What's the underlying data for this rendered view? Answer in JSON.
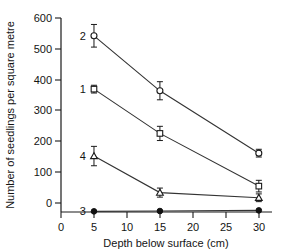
{
  "chart_data": {
    "type": "line",
    "title": "",
    "xlabel": "Depth below surface (cm)",
    "ylabel": "Number of seedlings per square metre",
    "x": [
      5,
      15,
      30
    ],
    "xlim": [
      0,
      32
    ],
    "ylim": [
      0,
      600
    ],
    "xticks": [
      0,
      5,
      10,
      15,
      20,
      25,
      30
    ],
    "xtick_labels": [
      "0",
      "5",
      "10",
      "15",
      "20",
      "25",
      "30"
    ],
    "yticks": [
      0,
      100,
      200,
      300,
      400,
      500,
      600
    ],
    "ytick_labels": [
      "0",
      "100",
      "200",
      "300",
      "400",
      "500",
      "600"
    ],
    "grid": false,
    "legend": "inline-labels-at-left-of-each-series",
    "series": [
      {
        "name": "2",
        "label": "2",
        "marker": "open-circle",
        "values": [
          545,
          375,
          182
        ],
        "errors": [
          35,
          28,
          12
        ],
        "label_x": 5,
        "label_y": 545
      },
      {
        "name": "1",
        "label": "1",
        "marker": "open-square",
        "values": [
          380,
          243,
          80
        ],
        "errors": [
          12,
          22,
          18
        ],
        "label_x": 5,
        "label_y": 380
      },
      {
        "name": "4",
        "label": "4",
        "marker": "open-triangle",
        "values": [
          173,
          60,
          44
        ],
        "errors": [
          30,
          14,
          12
        ],
        "label_x": 5,
        "label_y": 173
      },
      {
        "name": "3",
        "label": "3",
        "marker": "filled-circle",
        "values": [
          2,
          3,
          5
        ],
        "errors": [
          0,
          0,
          0
        ],
        "label_x": 5,
        "label_y": 2
      }
    ],
    "colors": {
      "axis": "#1a1a1a",
      "line": "#333333",
      "marker_stroke": "#1a1a1a",
      "marker_fill_open": "#ffffff",
      "marker_fill_solid": "#111111",
      "background": "#ffffff"
    }
  }
}
